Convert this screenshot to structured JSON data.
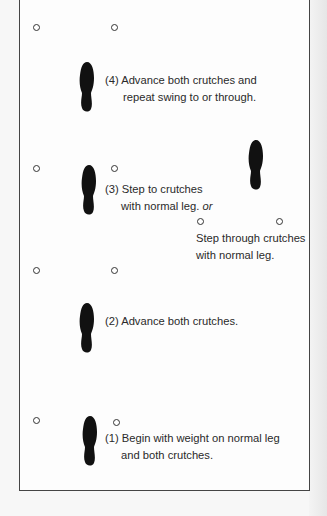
{
  "diagram": {
    "title_hidden": "Swing-to / swing-through crutch gait",
    "steps": [
      {
        "id": 4,
        "line1": "(4) Advance both crutches and",
        "line2": "repeat swing to or through."
      },
      {
        "id": 3,
        "line1": "(3) Step to crutches",
        "line2": "with normal leg.",
        "line2_suffix": "or"
      },
      {
        "id": "3b",
        "line1": "Step through crutches",
        "line2": "with normal leg."
      },
      {
        "id": 2,
        "line1": "(2) Advance both crutches."
      },
      {
        "id": 1,
        "line1": "(1) Begin with weight on normal leg",
        "line2": "and both crutches."
      }
    ],
    "legend": {
      "crutch_symbol": "open-circle",
      "foot_symbol": "black-footprint"
    },
    "colors": {
      "ink": "#111111",
      "frame": "#444444",
      "paper": "#fdfdfd"
    }
  }
}
